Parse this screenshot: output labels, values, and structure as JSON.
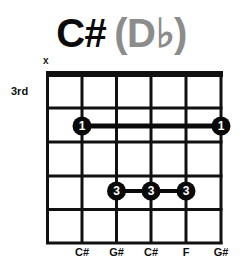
{
  "title": {
    "name": "C#",
    "alternate": "(D♭)"
  },
  "muted_strings": [
    {
      "string": 6,
      "symbol": "x"
    }
  ],
  "start_fret_label": "3rd",
  "diagram": {
    "strings": 6,
    "frets_shown": 5,
    "colors": {
      "grid": "#111111",
      "dot": "#0a0a0a",
      "dot_text": "#ffffff",
      "title_alt": "#8c8c8c"
    }
  },
  "barres": [
    {
      "finger": "1",
      "fret": 2,
      "from_string": 5,
      "to_string": 1
    },
    {
      "finger": "3",
      "fret": 4,
      "from_string": 4,
      "to_string": 2
    }
  ],
  "dots": [
    {
      "finger": "1",
      "string": 5,
      "fret": 2
    },
    {
      "finger": "1",
      "string": 1,
      "fret": 2
    },
    {
      "finger": "3",
      "string": 4,
      "fret": 4
    },
    {
      "finger": "3",
      "string": 3,
      "fret": 4
    },
    {
      "finger": "3",
      "string": 2,
      "fret": 4
    }
  ],
  "note_labels": [
    "C#",
    "G#",
    "C#",
    "F",
    "G#"
  ]
}
